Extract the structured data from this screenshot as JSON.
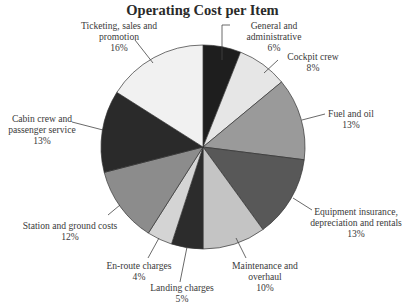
{
  "chart_data": {
    "type": "pie",
    "title": "Operating Cost per Item",
    "start_angle_deg": 0,
    "direction": "clockwise",
    "slices": [
      {
        "label": "General and administrative",
        "line1": "General and",
        "line2": "administrative",
        "value": 6,
        "pct": "6%",
        "color": "#1e1e1e"
      },
      {
        "label": "Cockpit crew",
        "line1": "Cockpit crew",
        "line2": "",
        "value": 8,
        "pct": "8%",
        "color": "#e6e6e6"
      },
      {
        "label": "Fuel and oil",
        "line1": "Fuel and oil",
        "line2": "",
        "value": 13,
        "pct": "13%",
        "color": "#9a9a9a"
      },
      {
        "label": "Equipment insurance, depreciation and rentals",
        "line1": "Equipment insurance,",
        "line2": "depreciation and rentals",
        "value": 13,
        "pct": "13%",
        "color": "#585858"
      },
      {
        "label": "Maintenance and overhaul",
        "line1": "Maintenance and",
        "line2": "overhaul",
        "value": 10,
        "pct": "10%",
        "color": "#c4c4c4"
      },
      {
        "label": "Landing charges",
        "line1": "Landing charges",
        "line2": "",
        "value": 5,
        "pct": "5%",
        "color": "#2c2c2c"
      },
      {
        "label": "En-route charges",
        "line1": "En-route charges",
        "line2": "",
        "value": 4,
        "pct": "4%",
        "color": "#d4d4d4"
      },
      {
        "label": "Station and ground costs",
        "line1": "Station and ground costs",
        "line2": "",
        "value": 12,
        "pct": "12%",
        "color": "#8c8c8c"
      },
      {
        "label": "Cabin crew and passenger service",
        "line1": "Cabin crew and",
        "line2": "passenger service",
        "value": 13,
        "pct": "13%",
        "color": "#2a2a2a"
      },
      {
        "label": "Ticketing, sales and promotion",
        "line1": "Ticketing, sales and",
        "line2": "promotion",
        "value": 16,
        "pct": "16%",
        "color": "#f1f1f1"
      }
    ],
    "legend": "none (leader-line labels)"
  }
}
